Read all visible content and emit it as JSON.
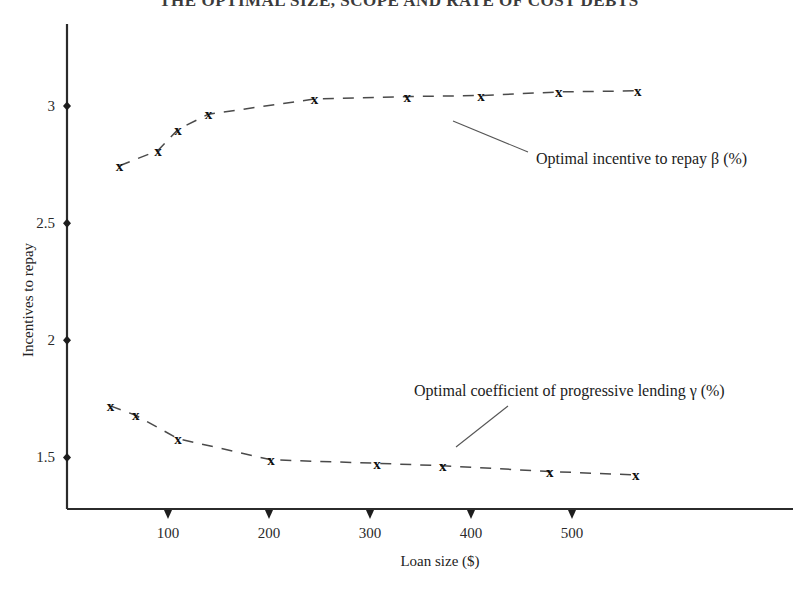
{
  "chart_data": {
    "type": "line",
    "title": "THE OPTIMAL SIZE, SCOPE AND  RATE OF  COST DEBTS",
    "xlabel": "Loan size ($)",
    "ylabel": "Incentives to repay",
    "xlim": [
      0,
      600
    ],
    "ylim": [
      1.28,
      3.35
    ],
    "xticks": [
      100,
      200,
      300,
      400,
      500
    ],
    "xticklabels": [
      "100",
      "200",
      "300",
      "400",
      "500"
    ],
    "yticks": [
      1.5,
      2,
      2.5,
      3
    ],
    "yticklabels": [
      "1.5",
      "2",
      "2.5",
      "3"
    ],
    "grid": false,
    "legend_position": "inline-annotations",
    "marker": "x",
    "linestyle": "dashed",
    "series": [
      {
        "name": "Optimal incentive to repay β (%)",
        "symbol": "β",
        "x": [
          52,
          90,
          110,
          140,
          245,
          337,
          410,
          487,
          565
        ],
        "values": [
          2.745,
          2.81,
          2.9,
          2.965,
          3.03,
          3.04,
          3.045,
          3.06,
          3.065
        ]
      },
      {
        "name": "Optimal coefficient of progressive lending γ (%)",
        "symbol": "γ",
        "x": [
          43,
          68,
          110,
          202,
          307,
          372,
          478,
          563
        ],
        "values": [
          1.72,
          1.68,
          1.58,
          1.49,
          1.475,
          1.465,
          1.44,
          1.425
        ]
      }
    ],
    "annotations": [
      {
        "text": "Optimal incentive to repay β (%)",
        "label_x": 536,
        "label_y": 164,
        "leader_from_x": 528,
        "leader_from_y": 152,
        "leader_to_x": 453,
        "leader_to_y": 121
      },
      {
        "text": "Optimal coefficient of progressive lending γ (%)",
        "label_x": 414,
        "label_y": 396,
        "leader_from_x": 508,
        "leader_from_y": 406,
        "leader_to_x": 456,
        "leader_to_y": 447
      }
    ]
  },
  "colors": {
    "axis": "#2b2b2b",
    "series_line": "#4a4a4a",
    "marker": "#101010",
    "text": "#1a1a1a",
    "background": "#ffffff"
  }
}
